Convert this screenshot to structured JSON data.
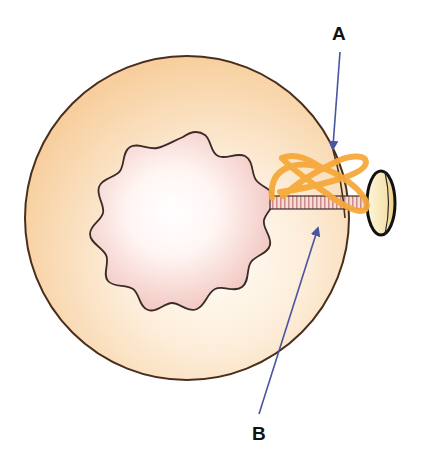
{
  "diagram": {
    "labels": {
      "a": "A",
      "b": "B"
    },
    "annotations": [
      {
        "label": "A",
        "points_to": "orange looped fibers at cell membrane"
      },
      {
        "label": "B",
        "points_to": "striated stalk / cytoplasm near stalk"
      }
    ],
    "colors": {
      "cell_fill_outer": "#f8d4a8",
      "cell_fill_inner": "#fffaf2",
      "cell_outline": "#4a2e1c",
      "lumen_fill_outer": "#f2c6c0",
      "lumen_fill_inner": "#ffffff",
      "lumen_outline": "#3a2a2a",
      "fiber_color": "#f5a93a",
      "stalk_fill": "#f5d6d2",
      "stalk_stripe": "#c98b8b",
      "knob_fill": "#f9e7b8",
      "knob_outline": "#111111",
      "arrow_color": "#4a55a0"
    }
  }
}
